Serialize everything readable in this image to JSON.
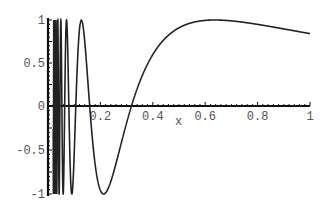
{
  "chart_data": {
    "type": "line",
    "function": "sin(1/x)",
    "title": "",
    "xlabel": "x",
    "ylabel": "",
    "xlim": [
      0,
      1
    ],
    "ylim": [
      -1,
      1
    ],
    "grid": false,
    "x_ticks": [
      "0.2",
      "0.4",
      "0.6",
      "0.8",
      "1"
    ],
    "y_ticks": [
      "1",
      "0.5",
      "0",
      "-0.5",
      "-1"
    ],
    "key_points": [
      {
        "x": 0.127,
        "y": 1
      },
      {
        "x": 0.212,
        "y": -1
      },
      {
        "x": 0.318,
        "y": 0
      },
      {
        "x": 0.637,
        "y": 1
      },
      {
        "x": 1.0,
        "y": 0.841
      }
    ],
    "line_color": "#222222"
  }
}
